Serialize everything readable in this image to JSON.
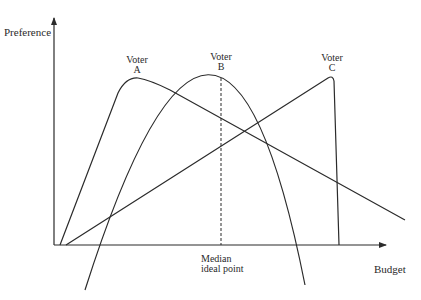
{
  "diagram": {
    "y_axis_label": "Preference",
    "x_axis_label": "Budget",
    "median_label_line1": "Median",
    "median_label_line2": "ideal point",
    "voters": [
      {
        "id": "A",
        "label_line1": "Voter",
        "label_line2": "A",
        "shape": "single-peaked, peak at low budget"
      },
      {
        "id": "B",
        "label_line1": "Voter",
        "label_line2": "B",
        "shape": "single-peaked parabola, peak at median budget"
      },
      {
        "id": "C",
        "label_line1": "Voter",
        "label_line2": "C",
        "shape": "single-peaked, peak at high budget"
      }
    ],
    "colors": {
      "line": "#2b2b2b",
      "background": "#ffffff",
      "text": "#2a2a2a"
    }
  }
}
